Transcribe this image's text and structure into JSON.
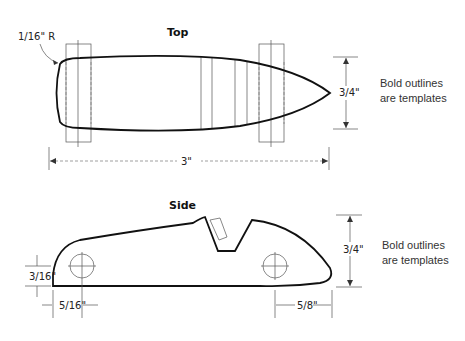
{
  "top_view": {
    "title": "Top",
    "radius_label": "1/16\" R",
    "length_label": "3\"",
    "width_label": "3/4\""
  },
  "side_view": {
    "title": "Side",
    "height_label": "3/4\"",
    "front_axle_height_label": "3/16\"",
    "front_axle_offset_label": "5/16\"",
    "rear_axle_offset_label": "5/8\""
  },
  "notes": {
    "top_note_line1": "Bold outlines",
    "top_note_line2": "are templates",
    "side_note_line1": "Bold outlines",
    "side_note_line2": "are templates"
  },
  "colors": {
    "outline": "#111111",
    "guide": "#555555",
    "background": "#ffffff"
  }
}
